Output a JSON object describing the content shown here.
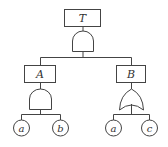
{
  "diagram": {
    "type": "fault-tree",
    "top_event": {
      "label": "T",
      "gate": "AND"
    },
    "intermediate_events": [
      {
        "label": "A",
        "gate": "AND",
        "children": [
          "a",
          "b"
        ]
      },
      {
        "label": "B",
        "gate": "OR",
        "children": [
          "a",
          "c"
        ]
      }
    ],
    "basic_events": [
      {
        "label": "a",
        "parent": "A"
      },
      {
        "label": "b",
        "parent": "A"
      },
      {
        "label": "a",
        "parent": "B"
      },
      {
        "label": "c",
        "parent": "B"
      }
    ],
    "colors": {
      "stroke": "#444444",
      "background": "#ffffff"
    }
  }
}
